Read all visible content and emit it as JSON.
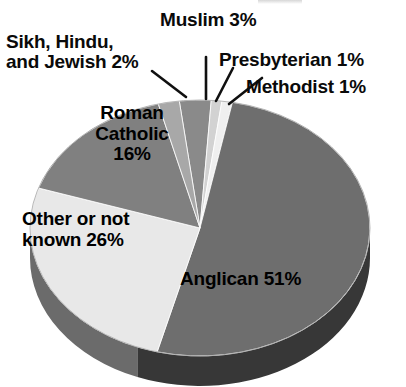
{
  "chart_data": {
    "type": "pie",
    "title": "",
    "subtitle": "",
    "xlabel": "",
    "ylabel": "",
    "legend_position": "none",
    "grid": false,
    "units": "percent",
    "total": 100,
    "start_angle_deg": -97,
    "direction": "clockwise",
    "categories": [
      "Muslim",
      "Presbyterian",
      "Methodist",
      "Anglican",
      "Other or not known",
      "Roman Catholic",
      "Sikh, Hindu, and Jewish"
    ],
    "values": [
      3,
      1,
      1,
      51,
      26,
      16,
      2
    ],
    "slices": [
      {
        "name": "Muslim",
        "value": 3,
        "label": "Muslim 3%",
        "label_placement": "outside",
        "color": "#8a8a8a",
        "side_color": "#4a4a4a",
        "leader": "vertical"
      },
      {
        "name": "Presbyterian",
        "value": 1,
        "label": "Presbyterian 1%",
        "label_placement": "outside",
        "color": "#d2d2d2",
        "side_color": "#7e7e7e",
        "leader": "diagonal"
      },
      {
        "name": "Methodist",
        "value": 1,
        "label": "Methodist 1%",
        "label_placement": "outside",
        "color": "#efefef",
        "side_color": "#8d8d8d",
        "leader": "diagonal"
      },
      {
        "name": "Anglican",
        "value": 51,
        "label": "Anglican 51%",
        "label_placement": "inside",
        "color": "#6e6e6e",
        "side_color": "#373737"
      },
      {
        "name": "Other or not known",
        "value": 26,
        "label": "Other or not\nknown 26%",
        "label_placement": "inside",
        "color": "#e8e8e8",
        "side_color": "#6b6b6b"
      },
      {
        "name": "Roman Catholic",
        "value": 16,
        "label": "Roman\nCatholic\n16%",
        "label_placement": "inside",
        "color": "#808080",
        "side_color": "#404040"
      },
      {
        "name": "Sikh, Hindu, and Jewish",
        "value": 2,
        "label": "Sikh, Hindu,\nand Jewish 2%",
        "label_placement": "outside",
        "color": "#a8a8a8",
        "side_color": "#585858",
        "leader": "diagonal"
      }
    ]
  },
  "labels": {
    "sikh_hindu_jewish": "Sikh, Hindu,\nand Jewish 2%",
    "muslim": "Muslim 3%",
    "presbyterian": "Presbyterian 1%",
    "methodist": "Methodist 1%",
    "roman_catholic": "Roman\nCatholic\n16%",
    "other_or_not_known": "Other or not\nknown 26%",
    "anglican": "Anglican 51%"
  },
  "colors": {
    "background": "#ffffff",
    "text": "#000000",
    "leader_line": "#101010",
    "anglican": "#6e6e6e",
    "anglican_side": "#373737",
    "other": "#e8e8e8",
    "other_side": "#6b6b6b",
    "roman_catholic": "#808080",
    "roman_catholic_side": "#404040",
    "sikh": "#a8a8a8",
    "muslim": "#8a8a8a",
    "presbyterian": "#d2d2d2",
    "methodist": "#efefef"
  }
}
